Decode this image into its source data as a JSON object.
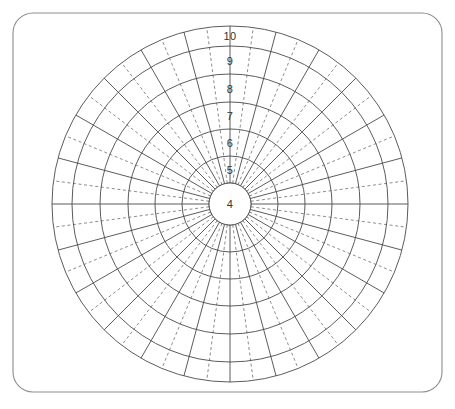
{
  "figure": {
    "title": "",
    "background_color": "#ffffff"
  },
  "card": {
    "name": "rounded-card-frame",
    "x": 13,
    "y": 13,
    "width": 429,
    "height": 379,
    "corner_radius": 20,
    "border_color": "#8d8d8d",
    "border_width": 1.1,
    "fill_color": "#ffffff"
  },
  "chart_data": {
    "type": "polar-grid",
    "title": "",
    "subtitle": "",
    "xlabel": "",
    "ylabel": "",
    "grid": true,
    "legend_position": "none",
    "center": {
      "x": 230,
      "y": 204
    },
    "outer_radius": 178,
    "radial_axis": {
      "label": "",
      "tick_labels": [
        "4",
        "5",
        "6",
        "7",
        "8",
        "9",
        "10"
      ],
      "tick_radii": [
        21,
        48,
        75,
        102,
        130,
        158,
        178
      ],
      "label_anchor_radii": [
        0,
        34,
        61,
        88,
        115,
        143,
        168
      ],
      "label_direction_degrees": 90,
      "range": [
        4,
        10
      ]
    },
    "rings": [
      {
        "label": "4",
        "inner_radius": 0,
        "outer_radius": 21,
        "label_radius": 0,
        "is_center_disc": true
      },
      {
        "label": "5",
        "inner_radius": 21,
        "outer_radius": 48,
        "label_radius": 34,
        "is_center_disc": false
      },
      {
        "label": "6",
        "inner_radius": 48,
        "outer_radius": 75,
        "label_radius": 61,
        "is_center_disc": false
      },
      {
        "label": "7",
        "inner_radius": 75,
        "outer_radius": 102,
        "label_radius": 88,
        "is_center_disc": false
      },
      {
        "label": "8",
        "inner_radius": 102,
        "outer_radius": 130,
        "label_radius": 115,
        "is_center_disc": false
      },
      {
        "label": "9",
        "inner_radius": 130,
        "outer_radius": 158,
        "label_radius": 143,
        "is_center_disc": false
      },
      {
        "label": "10",
        "inner_radius": 158,
        "outer_radius": 178,
        "label_radius": 168,
        "is_center_disc": false
      }
    ],
    "angular_axis": {
      "solid_spoke_count": 24,
      "solid_spoke_step_degrees": 15,
      "solid_spoke_offset_degrees": 0,
      "dashed_spoke_count": 24,
      "dashed_spoke_step_degrees": 15,
      "dashed_spoke_offset_degrees": 7.5,
      "spoke_inner_radius": 21,
      "spoke_outer_radius": 178
    },
    "style": {
      "circle_stroke_color": "#4a4a4a",
      "circle_stroke_width": 0.9,
      "solid_spoke_color": "#4a4a4a",
      "solid_spoke_width": 0.9,
      "dashed_spoke_color": "#6e6e6e",
      "dashed_spoke_width": 0.8,
      "dash_pattern": "3,2.6",
      "label_color": "#333333",
      "label_font_size": 11,
      "center_fill": "#ffffff"
    }
  }
}
